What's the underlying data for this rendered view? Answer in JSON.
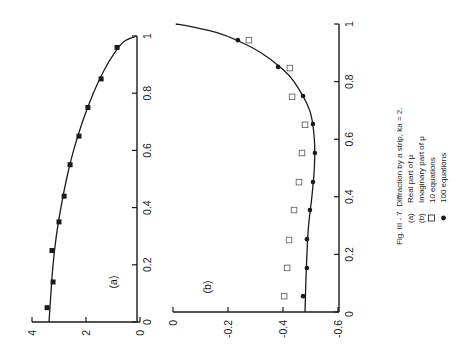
{
  "chart_data": [
    {
      "type": "scatter",
      "panel_label": "(a)",
      "title": "Real part of μ",
      "orientation": "rotated 90° counter-clockwise",
      "xlabel": "",
      "ylabel": "",
      "xlim": [
        0,
        1
      ],
      "ylim": [
        0,
        4
      ],
      "x_ticks": [
        "0",
        "0.2",
        "0.4",
        "0.6",
        "0.8",
        "1"
      ],
      "x_tick_values": [
        0,
        0.2,
        0.4,
        0.6,
        0.8,
        1
      ],
      "y_ticks": [
        "0",
        "2",
        "4"
      ],
      "y_tick_values": [
        0,
        2,
        4
      ],
      "grid": false,
      "series": [
        {
          "name": "100 equations (curve)",
          "kind": "line",
          "x": [
            0,
            0.1,
            0.2,
            0.3,
            0.4,
            0.5,
            0.6,
            0.7,
            0.8,
            0.88,
            0.94,
            0.98,
            1.0
          ],
          "y": [
            3.37,
            3.3,
            3.22,
            3.1,
            2.93,
            2.72,
            2.46,
            2.13,
            1.73,
            1.33,
            0.95,
            0.6,
            0.12
          ]
        },
        {
          "name": "10 equations",
          "kind": "square-markers",
          "x": [
            0.05,
            0.14,
            0.25,
            0.35,
            0.44,
            0.55,
            0.65,
            0.75,
            0.85,
            0.96
          ],
          "y": [
            3.44,
            3.22,
            3.26,
            3.0,
            2.81,
            2.59,
            2.26,
            1.93,
            1.44,
            0.85
          ]
        }
      ]
    },
    {
      "type": "scatter",
      "panel_label": "(b)",
      "title": "Imaginary part of μ",
      "orientation": "rotated 90° counter-clockwise",
      "xlabel": "",
      "ylabel": "",
      "xlim": [
        0,
        1
      ],
      "ylim": [
        -0.6,
        0
      ],
      "x_ticks": [
        "0",
        "0.2",
        "0.4",
        "0.6",
        "0.8",
        "1"
      ],
      "x_tick_values": [
        0,
        0.2,
        0.4,
        0.6,
        0.8,
        1
      ],
      "y_ticks": [
        "0",
        "-0.2",
        "-0.4",
        "-0.6"
      ],
      "y_tick_values": [
        0,
        -0.2,
        -0.4,
        -0.6
      ],
      "grid": false,
      "series": [
        {
          "name": "curve",
          "kind": "line",
          "x": [
            0,
            0.1,
            0.2,
            0.3,
            0.4,
            0.5,
            0.6,
            0.7,
            0.8,
            0.85,
            0.9,
            0.94,
            0.97,
            0.99,
            1.0
          ],
          "y": [
            -0.48,
            -0.483,
            -0.487,
            -0.493,
            -0.505,
            -0.514,
            -0.514,
            -0.497,
            -0.44,
            -0.39,
            -0.32,
            -0.24,
            -0.16,
            -0.07,
            -0.01
          ]
        },
        {
          "name": "10 equations",
          "kind": "open-square-markers",
          "x": [
            0.055,
            0.153,
            0.25,
            0.354,
            0.451,
            0.552,
            0.65,
            0.747,
            0.847,
            0.944
          ],
          "y": [
            -0.404,
            -0.415,
            -0.422,
            -0.44,
            -0.458,
            -0.469,
            -0.48,
            -0.433,
            -0.425,
            -0.276
          ]
        },
        {
          "name": "100 equations",
          "kind": "filled-circle-markers",
          "x": [
            0.055,
            0.153,
            0.253,
            0.354,
            0.451,
            0.552,
            0.653,
            0.75,
            0.851,
            0.944
          ],
          "y": [
            -0.473,
            -0.487,
            -0.487,
            -0.498,
            -0.509,
            -0.516,
            -0.509,
            -0.473,
            -0.382,
            -0.236
          ]
        }
      ]
    }
  ],
  "caption": {
    "title": "Fig. III - 7.  Diffraction by a strip,  ka = 2.",
    "items": [
      {
        "key": "(a)",
        "text": "Real part of  μ"
      },
      {
        "key": "(b)",
        "text": "Imaginary part of  μ"
      },
      {
        "key": "□",
        "text": "10 equations"
      },
      {
        "key": "●",
        "text": "100 equations"
      }
    ]
  }
}
